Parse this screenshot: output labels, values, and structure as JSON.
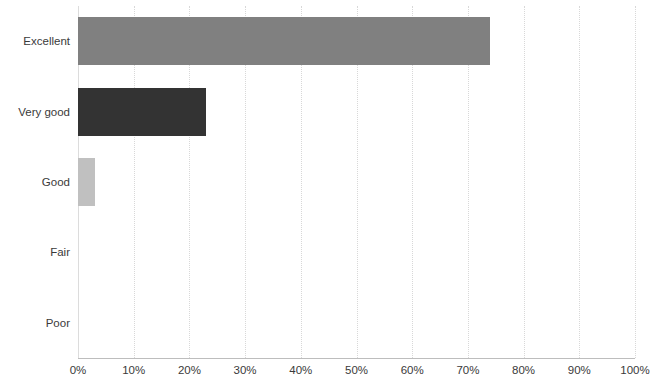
{
  "chart_data": {
    "type": "bar",
    "orientation": "horizontal",
    "title": "",
    "subtitle": "",
    "xlabel": "",
    "ylabel": "",
    "categories": [
      "Excellent",
      "Very good",
      "Good",
      "Fair",
      "Poor"
    ],
    "values": [
      74,
      23,
      3,
      0,
      0
    ],
    "value_suffix": "%",
    "bar_colors": [
      "#808080",
      "#333333",
      "#c0c0c0",
      "#808080",
      "#808080"
    ],
    "xlim": [
      0,
      100
    ],
    "xtick_labels": [
      "0%",
      "10%",
      "20%",
      "30%",
      "40%",
      "50%",
      "60%",
      "70%",
      "80%",
      "90%",
      "100%"
    ],
    "xtick_values": [
      0,
      10,
      20,
      30,
      40,
      50,
      60,
      70,
      80,
      90,
      100
    ],
    "grid": true,
    "grid_axis": "x",
    "grid_color": "#d8d8d8",
    "legend": false,
    "legend_position": "none",
    "axis_line_color": "#bdbdbd",
    "label_color": "#3a3a3a",
    "background": "#ffffff"
  }
}
